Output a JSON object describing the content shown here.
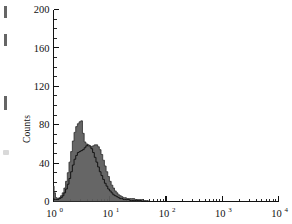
{
  "figure": {
    "background_color": "#ffffff",
    "ink_color": "#111111"
  },
  "axes": {
    "y_title": "Counts",
    "y_ticks": [
      "0",
      "40",
      "80",
      "120",
      "160",
      "200"
    ],
    "y_minor_step": 10,
    "x_tick_labels": [
      {
        "base": "10",
        "exp": "0"
      },
      {
        "base": "10",
        "exp": "1"
      },
      {
        "base": "10",
        "exp": "2"
      },
      {
        "base": "10",
        "exp": "3"
      },
      {
        "base": "10",
        "exp": "4"
      }
    ]
  },
  "chart_data": {
    "type": "line",
    "title": "",
    "subtitle": "",
    "xlabel": "",
    "ylabel": "Counts",
    "xscale": "log",
    "xlim": [
      1,
      10000
    ],
    "ylim": [
      0,
      200
    ],
    "grid": false,
    "legend": "none",
    "annotations": [],
    "series": [
      {
        "name": "filled-population",
        "style": "filled-histogram",
        "fill_color": "#5e5e5e",
        "line_color": "#2b2b2b",
        "peak_x": 3.1,
        "peak_y": 84,
        "x": [
          1.0,
          1.05,
          1.12,
          1.2,
          1.29,
          1.38,
          1.48,
          1.58,
          1.7,
          1.82,
          1.95,
          2.09,
          2.24,
          2.4,
          2.57,
          2.75,
          2.95,
          3.16,
          3.39,
          3.63,
          3.89,
          4.17,
          4.47,
          4.79,
          5.13,
          5.5,
          5.89,
          6.31,
          6.76,
          7.24,
          7.76,
          8.32,
          8.91,
          9.55,
          10.2,
          11.0,
          11.7,
          12.6,
          13.5,
          14.5,
          15.5,
          16.6,
          17.8,
          19.1,
          20.4,
          21.9,
          23.4,
          25.1,
          26.9,
          28.8,
          30.9,
          33.1,
          35.5,
          38.0,
          40.7,
          43.7,
          46.8,
          50.1
        ],
        "y": [
          16,
          9,
          4,
          3,
          4,
          6,
          9,
          14,
          21,
          30,
          41,
          52,
          63,
          72,
          78,
          81,
          83,
          84,
          71,
          62,
          60,
          58,
          57,
          57,
          58,
          59,
          59,
          57,
          54,
          49,
          43,
          37,
          31,
          26,
          21,
          17,
          14,
          11,
          9,
          7,
          6,
          5,
          4,
          4,
          3,
          3,
          3,
          3,
          3,
          2,
          2,
          2,
          2,
          2,
          1,
          1,
          1,
          0
        ]
      },
      {
        "name": "open-population",
        "style": "open-histogram",
        "fill_color": "none",
        "line_color": "#141414",
        "peak_x": 4.3,
        "peak_y": 59,
        "x": [
          1.0,
          1.05,
          1.12,
          1.2,
          1.29,
          1.38,
          1.48,
          1.58,
          1.7,
          1.82,
          1.95,
          2.09,
          2.24,
          2.4,
          2.57,
          2.75,
          2.95,
          3.16,
          3.39,
          3.63,
          3.89,
          4.17,
          4.47,
          4.79,
          5.13,
          5.5,
          5.89,
          6.31,
          6.76,
          7.24,
          7.76,
          8.32,
          8.91,
          9.55,
          10.2,
          11.0,
          11.7,
          12.6,
          13.5,
          14.5,
          15.5,
          16.6,
          17.8,
          19.1,
          20.4,
          21.9,
          23.4,
          25.1,
          26.9,
          28.8,
          30.9,
          33.1,
          35.5,
          38.0,
          40.7,
          43.7,
          46.8,
          50.1
        ],
        "y": [
          3,
          2,
          2,
          2,
          3,
          4,
          6,
          9,
          13,
          18,
          24,
          31,
          38,
          44,
          48,
          51,
          52,
          53,
          54,
          56,
          58,
          59,
          58,
          55,
          51,
          46,
          41,
          36,
          31,
          27,
          23,
          19,
          16,
          13,
          11,
          9,
          7,
          6,
          5,
          4,
          3,
          3,
          2,
          2,
          2,
          2,
          1,
          1,
          1,
          1,
          1,
          1,
          1,
          0,
          0,
          0,
          0,
          0
        ]
      }
    ]
  }
}
